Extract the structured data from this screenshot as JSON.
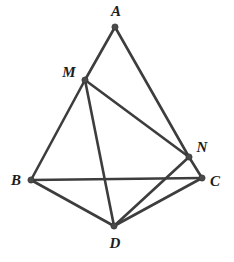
{
  "figure": {
    "background_color": "#ffffff",
    "edge_color": "#3d3d3d",
    "vertex_color": "#4a4a4a",
    "label_color": "#1c1c1c",
    "width": 234,
    "height": 262
  },
  "vertices": [
    {
      "id": "A",
      "label": "A",
      "x": 115,
      "y": 27,
      "label_x": 116,
      "label_y": 11
    },
    {
      "id": "M",
      "label": "M",
      "x": 85,
      "y": 80,
      "label_x": 69,
      "label_y": 72
    },
    {
      "id": "N",
      "label": "N",
      "x": 189,
      "y": 157,
      "label_x": 202,
      "label_y": 147
    },
    {
      "id": "B",
      "label": "B",
      "x": 31,
      "y": 180,
      "label_x": 16,
      "label_y": 180
    },
    {
      "id": "C",
      "label": "C",
      "x": 202,
      "y": 178,
      "label_x": 215,
      "label_y": 181
    },
    {
      "id": "D",
      "label": "D",
      "x": 114,
      "y": 226,
      "label_x": 115,
      "label_y": 243
    }
  ],
  "edges": [
    {
      "id": "AM",
      "from": "A",
      "to": "M"
    },
    {
      "id": "AN",
      "from": "A",
      "to": "N"
    },
    {
      "id": "MN",
      "from": "M",
      "to": "N"
    },
    {
      "id": "MB",
      "from": "M",
      "to": "B"
    },
    {
      "id": "MD",
      "from": "M",
      "to": "D"
    },
    {
      "id": "BC",
      "from": "B",
      "to": "C"
    },
    {
      "id": "BD",
      "from": "B",
      "to": "D"
    },
    {
      "id": "NC",
      "from": "N",
      "to": "C"
    },
    {
      "id": "ND",
      "from": "N",
      "to": "D"
    },
    {
      "id": "DC",
      "from": "D",
      "to": "C"
    }
  ]
}
